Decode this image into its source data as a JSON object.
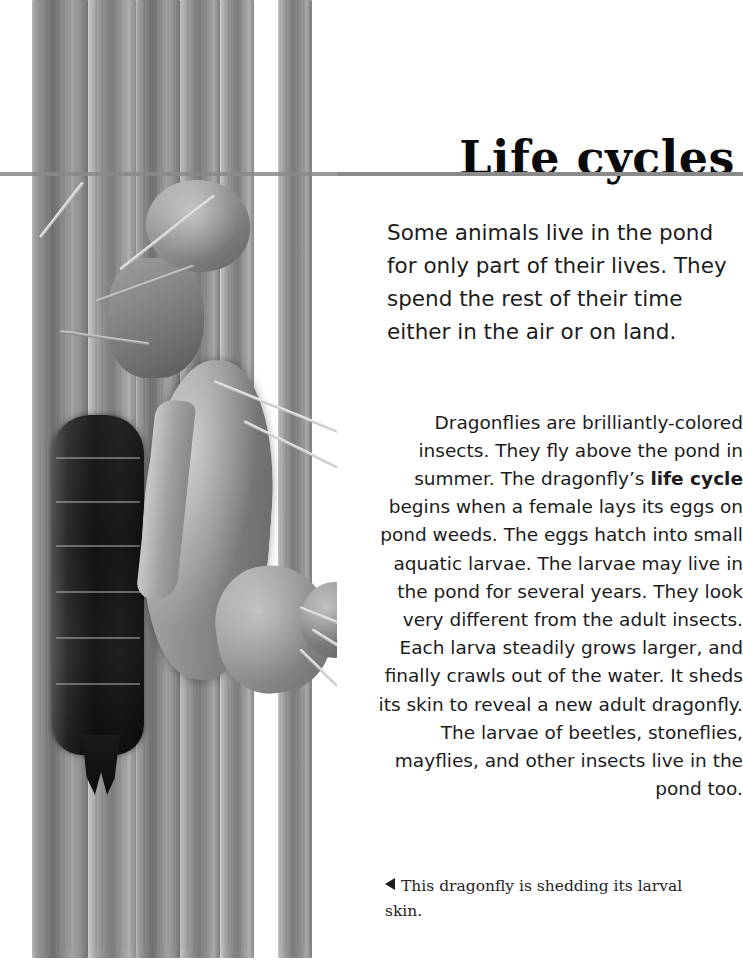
{
  "page": {
    "title": "Life cycles",
    "intro_paragraph": "Some animals live in the pond for only part of their lives. They spend the rest of their time either in the air or on land.",
    "body_paragraph_before_bold": "Dragonflies are brilliantly-colored insects. They fly above the pond in summer. The dragonfly’s ",
    "body_bold_term": "life cycle",
    "body_paragraph_after_bold": " begins when a female lays its eggs on pond weeds. The eggs hatch into small aquatic larvae. The larvae may live in the pond for several years. They look very different from the adult insects. Each larva steadily grows larger, and finally crawls out of the water. It sheds its skin to reveal a new adult dragonfly. The larvae of beetles, stoneflies, mayflies, and other insects live in the pond too.",
    "caption": "This dragonfly is shedding its larval skin.",
    "caption_marker": "left-triangle-marker"
  },
  "photo": {
    "subject": "dragonfly-emerging-from-larval-skin-on-reed-stems",
    "treatment": "black-and-white photograph"
  },
  "colors": {
    "rule": "#8a8a8a",
    "text": "#1c1c1c",
    "title": "#0a0a0a",
    "background": "#ffffff"
  }
}
